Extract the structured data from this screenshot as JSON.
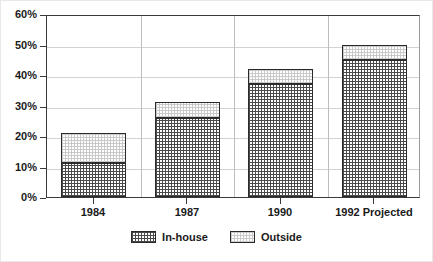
{
  "chart_data": {
    "type": "bar",
    "subtype": "stacked-bar",
    "title": "",
    "xlabel": "",
    "ylabel": "",
    "categories": [
      "1984",
      "1987",
      "1990",
      "1992 Projected"
    ],
    "series": [
      {
        "name": "In-house",
        "values": [
          11,
          26,
          37,
          45
        ],
        "fill": "crosshatch-dark"
      },
      {
        "name": "Outside",
        "values": [
          10,
          5,
          5,
          5
        ],
        "fill": "dotted-light"
      }
    ],
    "totals": [
      21,
      31,
      42,
      50
    ],
    "ylim": [
      0,
      60
    ],
    "yticks": [
      0,
      10,
      20,
      30,
      40,
      50,
      60
    ],
    "ytick_labels": [
      "0%",
      "10%",
      "20%",
      "30%",
      "40%",
      "50%",
      "60%"
    ],
    "grid": true,
    "grid_axis": "both",
    "legend_position": "bottom-center",
    "value_suffix": "%",
    "colors": {
      "axis": "#3a3a3a",
      "grid": "#d2d2d2",
      "bar_outline": "#2b2b2b",
      "in_house_fill": "#4a4a4a",
      "outside_fill": "#c9c9c9",
      "background": "#ffffff",
      "text": "#1a1a1a"
    }
  },
  "legend": {
    "items": [
      {
        "label": "In-house",
        "swatch": "crosshatch-dark-swatch"
      },
      {
        "label": "Outside",
        "swatch": "dotted-light-swatch"
      }
    ]
  }
}
